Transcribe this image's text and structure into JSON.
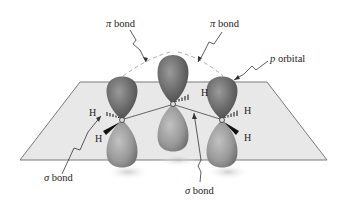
{
  "diagram": {
    "labels": {
      "pi_bond_left": {
        "symbol": "π",
        "text": " bond"
      },
      "pi_bond_right": {
        "symbol": "π",
        "text": " bond"
      },
      "p_orbital": {
        "symbol": "p",
        "text": " orbital"
      },
      "sigma_bond_left": {
        "symbol": "σ",
        "text": " bond"
      },
      "sigma_bond_right": {
        "symbol": "σ",
        "text": " bond"
      }
    },
    "atoms": {
      "carbon": "C",
      "hydrogen": "H",
      "h_left_top": "H",
      "h_left_bottom": "H",
      "h_center": "H",
      "h_right_top": "H",
      "h_right_bottom": "H"
    },
    "colors": {
      "lobe_upper": "#6e6e6e",
      "lobe_lower": "#9a9a9a",
      "plane_fill": "#e6e6e6",
      "plane_edge": "#7a7a7a",
      "text": "#222222"
    }
  }
}
